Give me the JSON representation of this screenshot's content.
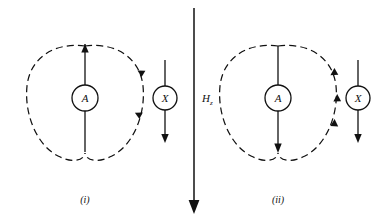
{
  "figure": {
    "background_color": "#ffffff",
    "ink_color": "#111111",
    "width": 389,
    "height": 221,
    "kind": "physics-field-line-diagram"
  },
  "field_axis": {
    "label_base": "H",
    "label_subscript": "z",
    "direction": "down",
    "arrow_name": "applied-field-arrow"
  },
  "panels": [
    {
      "caption": "(i)",
      "coil": {
        "label": "A",
        "current_arrow_direction": "up",
        "lobe_arrow_direction": "down",
        "lobe_arrow_count": 2
      },
      "specimen": {
        "label": "X",
        "arrow_direction": "down"
      }
    },
    {
      "caption": "(ii)",
      "coil": {
        "label": "A",
        "current_arrow_direction": "down",
        "lobe_arrow_direction": "up",
        "lobe_arrow_count": 3
      },
      "specimen": {
        "label": "X",
        "arrow_direction": "down"
      }
    }
  ]
}
